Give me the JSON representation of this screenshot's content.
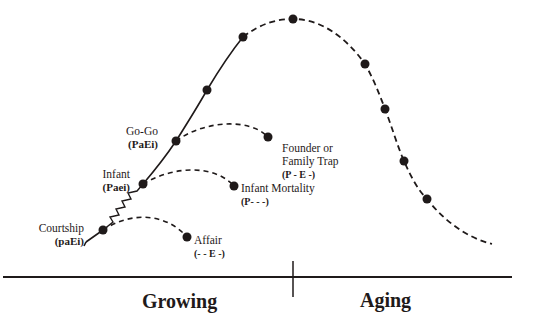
{
  "diagram": {
    "type": "lifecycle-curve",
    "colors": {
      "ink": "#1f1a1a",
      "background": "#ffffff"
    },
    "phases": [
      {
        "label": "Growing"
      },
      {
        "label": "Aging"
      }
    ],
    "stages": [
      {
        "name": "Courtship",
        "code": "(paEi)"
      },
      {
        "name": "Infant",
        "code": "(Paei)"
      },
      {
        "name": "Go-Go",
        "code": "(PaEi)"
      }
    ],
    "traps": [
      {
        "name": "Affair",
        "code": "(- - E -)"
      },
      {
        "name": "Infant Mortality",
        "code": "(P- - -)"
      },
      {
        "name_line1": "Founder or",
        "name_line2": "Family Trap",
        "code": "(P - E -)"
      }
    ]
  }
}
